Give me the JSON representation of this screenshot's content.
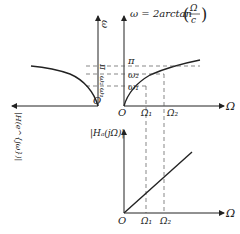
{
  "diagram": {
    "formula": {
      "lhs": "ω = 2arctan",
      "frac_num": "Ω",
      "frac_den": "c"
    },
    "top_right_axes": {
      "x_label": "Ω",
      "y_label": "ω",
      "origin": "O",
      "y_ticks": [
        "π",
        "ω₂",
        "ω₁"
      ],
      "x_ticks": [
        "Ω₁",
        "Ω₂"
      ]
    },
    "top_left_axes": {
      "y_label": "ω",
      "origin": "O",
      "y_ticks": [
        "π",
        "ω₂",
        "ω₁"
      ],
      "x_label": "|H(e^{jω})|"
    },
    "bottom_axes": {
      "y_label": "|Hₐ(jΩ)|",
      "x_label": "Ω",
      "origin": "O",
      "x_ticks": [
        "Ω₁",
        "Ω₂"
      ]
    },
    "colors": {
      "line": "#222222",
      "dashed": "#555555"
    }
  }
}
